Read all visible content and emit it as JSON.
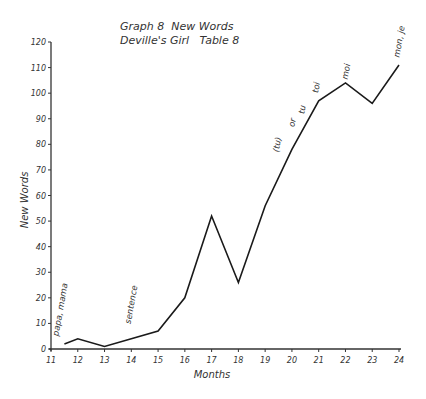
{
  "chart_data": {
    "type": "line",
    "title": "Graph 8  New Words",
    "subtitle": "Deville's Girl   Table 8",
    "xlabel": "Months",
    "ylabel": "New Words",
    "xlim": [
      11,
      24
    ],
    "ylim": [
      0,
      120
    ],
    "grid": false,
    "x_ticks": [
      "11",
      "12",
      "13",
      "14",
      "15",
      "16",
      "17",
      "18",
      "19",
      "20",
      "21",
      "22",
      "23",
      "24"
    ],
    "y_ticks": [
      "0",
      "10",
      "20",
      "30",
      "40",
      "50",
      "60",
      "70",
      "80",
      "90",
      "100",
      "110",
      "120"
    ],
    "series": [
      {
        "name": "New Words",
        "x": [
          11.5,
          12,
          13,
          14,
          15,
          16,
          17,
          18,
          19,
          20,
          21,
          22,
          23,
          24
        ],
        "y": [
          2,
          4,
          1,
          4,
          7,
          20,
          52,
          26,
          56,
          78,
          97,
          104,
          96,
          111
        ]
      }
    ],
    "annotations": [
      {
        "text": "papa, mama",
        "x": 11.3
      },
      {
        "text": "sentence",
        "x": 14
      },
      {
        "text": "(tu)",
        "x": 19.8
      },
      {
        "text": "or",
        "x": 20.3
      },
      {
        "text": "tu",
        "x": 20.8
      },
      {
        "text": "toi",
        "x": 21.1
      },
      {
        "text": "moi",
        "x": 22.3
      },
      {
        "text": "mon, je",
        "x": 24
      }
    ]
  }
}
